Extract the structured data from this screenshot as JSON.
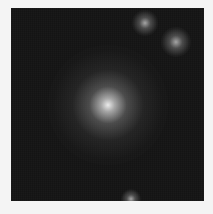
{
  "image": {
    "description": "Grayscale astronomical cutout with a bright central diffuse source and several fainter nearby sources on a dark background",
    "background_color": "#141414",
    "border_color": "#f4f4f4",
    "sources": [
      {
        "name": "central-galaxy",
        "x": 97,
        "y": 97,
        "size": 120,
        "kind": "core"
      },
      {
        "name": "faint-source-top",
        "x": 134,
        "y": 15,
        "size": 26,
        "kind": "blob"
      },
      {
        "name": "faint-source-upper-right",
        "x": 165,
        "y": 34,
        "size": 30,
        "kind": "blob"
      },
      {
        "name": "faint-source-bottom",
        "x": 120,
        "y": 191,
        "size": 20,
        "kind": "blob"
      }
    ]
  }
}
